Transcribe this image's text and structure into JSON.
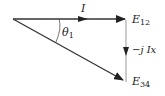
{
  "diagram": {
    "type": "phasor-diagram",
    "labels": {
      "current": "I",
      "angle": "θ",
      "angle_sub": "1",
      "e12": "E",
      "e12_sub": "12",
      "e34": "E",
      "e34_sub": "34",
      "drop": "−j Ix"
    },
    "colors": {
      "stroke": "#333333",
      "label": "#222222"
    }
  }
}
